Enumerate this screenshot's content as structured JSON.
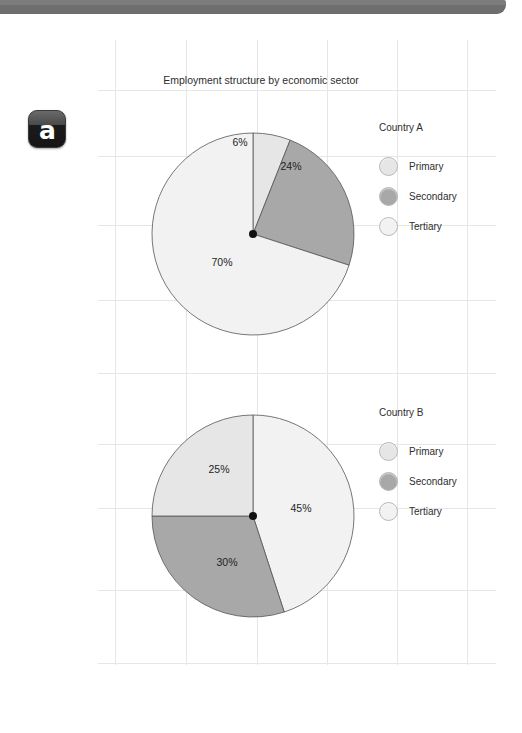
{
  "window": {
    "topbar_color": "#6e6e6e"
  },
  "logo": {
    "letter": "a",
    "name": "brand-logo-a"
  },
  "chart_data": [
    {
      "type": "pie",
      "title": "Employment structure by economic sector",
      "name": "Country A",
      "categories": [
        "Primary",
        "Secondary",
        "Tertiary"
      ],
      "values": [
        6,
        24,
        70
      ],
      "labels": [
        "6%",
        "24%",
        "70%"
      ],
      "colors": [
        "#e6e6e6",
        "#a8a8a8",
        "#f2f2f2"
      ],
      "start_angle": -90,
      "legend_position": "right"
    },
    {
      "type": "pie",
      "title": "",
      "name": "Country B",
      "categories": [
        "Primary",
        "Secondary",
        "Tertiary"
      ],
      "values": [
        25,
        30,
        45
      ],
      "labels": [
        "25%",
        "30%",
        "45%"
      ],
      "colors": [
        "#e6e6e6",
        "#a8a8a8",
        "#f2f2f2"
      ],
      "start_angle": -90,
      "legend_position": "right"
    }
  ],
  "charts": [
    {
      "id": "chart-a",
      "title": "Employment structure by economic sector",
      "legend_title": "Country A",
      "slices": [
        {
          "label": "6%",
          "value": 6,
          "category": "Primary",
          "color": "#e6e6e6",
          "label_x": 240,
          "label_y": 146
        },
        {
          "label": "24%",
          "value": 24,
          "category": "Secondary",
          "color": "#a8a8a8",
          "label_x": 291,
          "label_y": 170
        },
        {
          "label": "70%",
          "value": 70,
          "category": "Tertiary",
          "color": "#f2f2f2",
          "label_x": 222,
          "label_y": 266
        }
      ],
      "legend": [
        {
          "label": "Primary",
          "color": "#e6e6e6"
        },
        {
          "label": "Secondary",
          "color": "#a8a8a8"
        },
        {
          "label": "Tertiary",
          "color": "#f2f2f2"
        }
      ]
    },
    {
      "id": "chart-b",
      "title": "",
      "legend_title": "Country B",
      "slices": [
        {
          "label": "45%",
          "value": 45,
          "category": "Tertiary",
          "color": "#f2f2f2",
          "label_x": 301,
          "label_y": 512
        },
        {
          "label": "30%",
          "value": 30,
          "category": "Secondary",
          "color": "#a8a8a8",
          "label_x": 227,
          "label_y": 566
        },
        {
          "label": "25%",
          "value": 25,
          "category": "Primary",
          "color": "#e6e6e6",
          "label_x": 219,
          "label_y": 473
        }
      ],
      "legend": [
        {
          "label": "Primary",
          "color": "#e6e6e6"
        },
        {
          "label": "Secondary",
          "color": "#a8a8a8"
        },
        {
          "label": "Tertiary",
          "color": "#f2f2f2"
        }
      ]
    }
  ]
}
